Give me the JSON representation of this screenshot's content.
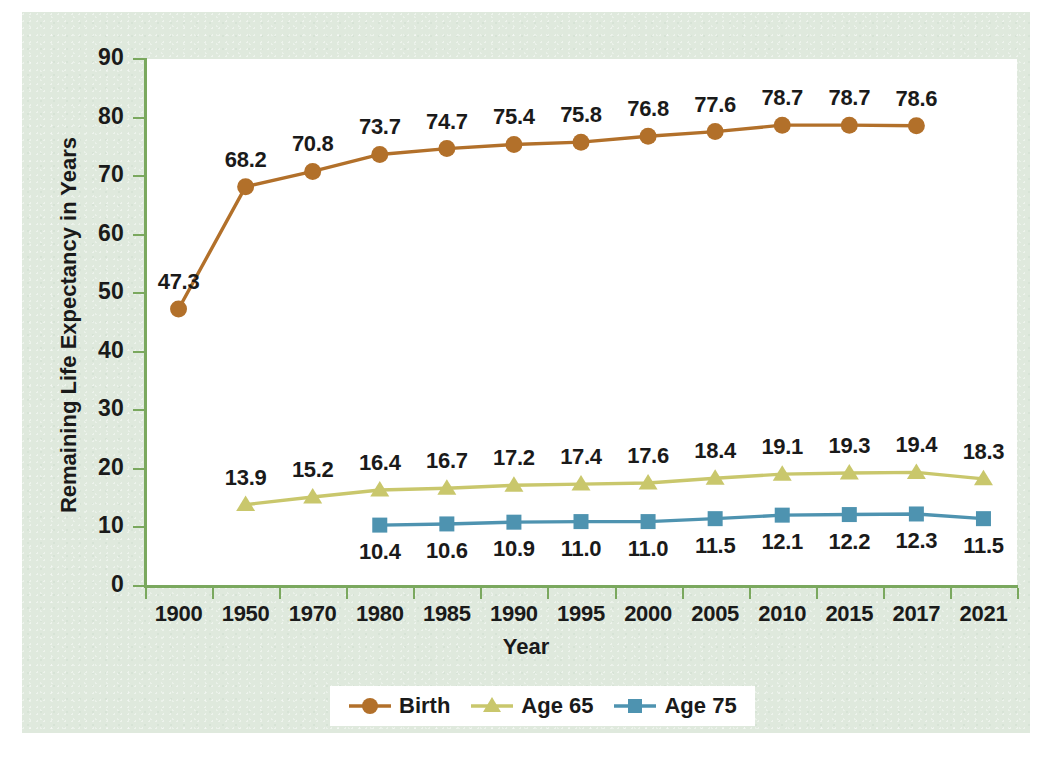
{
  "chart_data": {
    "type": "line",
    "title": "",
    "xlabel": "Year",
    "ylabel": "Remaining Life Expectancy in Years",
    "ylim": [
      0,
      90
    ],
    "yticks": [
      0,
      10,
      20,
      30,
      40,
      50,
      60,
      70,
      80,
      90
    ],
    "ytick_labels": [
      "0",
      "10",
      "20",
      "30",
      "40",
      "50",
      "60",
      "70",
      "80",
      "90"
    ],
    "grid": false,
    "legend_position": "bottom",
    "categories": [
      "1900",
      "1950",
      "1970",
      "1980",
      "1985",
      "1990",
      "1995",
      "2000",
      "2005",
      "2010",
      "2015",
      "2017",
      "2021"
    ],
    "series": [
      {
        "name": "Birth",
        "color": "#b2702a",
        "marker": "circle",
        "label_position": "above",
        "values": [
          47.3,
          68.2,
          70.8,
          73.7,
          74.7,
          75.4,
          75.8,
          76.8,
          77.6,
          78.7,
          78.7,
          78.6,
          null
        ],
        "value_labels": [
          "47.3",
          "68.2",
          "70.8",
          "73.7",
          "74.7",
          "75.4",
          "75.8",
          "76.8",
          "77.6",
          "78.7",
          "78.7",
          "78.6",
          ""
        ]
      },
      {
        "name": "Age 65",
        "color": "#c9c76c",
        "marker": "triangle",
        "label_position": "above",
        "values": [
          null,
          13.9,
          15.2,
          16.4,
          16.7,
          17.2,
          17.4,
          17.6,
          18.4,
          19.1,
          19.3,
          19.4,
          18.3
        ],
        "value_labels": [
          "",
          "13.9",
          "15.2",
          "16.4",
          "16.7",
          "17.2",
          "17.4",
          "17.6",
          "18.4",
          "19.1",
          "19.3",
          "19.4",
          "18.3"
        ]
      },
      {
        "name": "Age 75",
        "color": "#4e93b0",
        "marker": "square",
        "label_position": "below",
        "values": [
          null,
          null,
          null,
          10.4,
          10.6,
          10.9,
          11.0,
          11.0,
          11.5,
          12.1,
          12.2,
          12.3,
          11.5
        ],
        "value_labels": [
          "",
          "",
          "",
          "10.4",
          "10.6",
          "10.9",
          "11.0",
          "11.0",
          "11.5",
          "12.1",
          "12.2",
          "12.3",
          "11.5"
        ]
      }
    ]
  },
  "legend": {
    "items": [
      {
        "label": "Birth"
      },
      {
        "label": "Age 65"
      },
      {
        "label": "Age 75"
      }
    ]
  },
  "colors": {
    "panel_background": "#dfe9dd",
    "plot_background": "#ffffff",
    "axis": "#7aa85e",
    "birth": "#b2702a",
    "age65": "#c9c76c",
    "age75": "#4e93b0",
    "text": "#1a1a1a"
  }
}
